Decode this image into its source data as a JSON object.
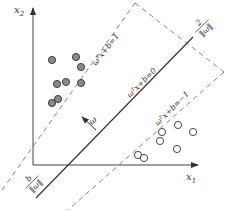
{
  "figure": {
    "type": "svm-margin-diagram",
    "axes": {
      "x_label": "x",
      "x_sub": "1",
      "y_label": "x",
      "y_sub": "2"
    },
    "lines": {
      "decision": "ωᵀx+b=0",
      "positive_margin": "ωᵀx+b=1",
      "negative_margin": "ωᵀx+b=−1"
    },
    "annotations": {
      "normal_vector": "ω",
      "margin_numerator": "2",
      "margin_denominator": "‖ω‖",
      "offset_numerator": "b",
      "offset_denominator": "‖ω‖"
    },
    "points": {
      "filled": [
        [
          52,
          60
        ],
        [
          76,
          57
        ],
        [
          81,
          67
        ],
        [
          57,
          84
        ],
        [
          66,
          82
        ],
        [
          81,
          83
        ],
        [
          52,
          103
        ],
        [
          58,
          99
        ]
      ],
      "open": [
        [
          138,
          155
        ],
        [
          144,
          158
        ],
        [
          160,
          141
        ],
        [
          162,
          132
        ],
        [
          178,
          125
        ],
        [
          177,
          149
        ],
        [
          193,
          132
        ]
      ]
    },
    "colors": {
      "line": "#333333",
      "dashed": "#777777",
      "filled_point": "#8a8a8a",
      "point_stroke": "#333333"
    }
  }
}
